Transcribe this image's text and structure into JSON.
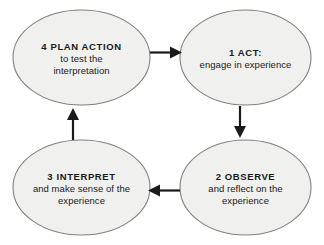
{
  "diagram": {
    "name": "experiential-learning-cycle",
    "background_color": "#ffffff",
    "node_fill": "#f0f0ee",
    "node_stroke": "#808080",
    "arrow_color": "#1a1a1a",
    "text_color": "#1a1a1a",
    "nodes": [
      {
        "id": "plan",
        "title": "4 PLAN ACTION",
        "line2": "to test the",
        "line3": "interpretation",
        "position": "top-left"
      },
      {
        "id": "act",
        "title": "1 ACT:",
        "line2": "engage in experience",
        "line3": "",
        "position": "top-right"
      },
      {
        "id": "observe",
        "title": "2 OBSERVE",
        "line2": "and reflect on the",
        "line3": "experience",
        "position": "bottom-right"
      },
      {
        "id": "interpret",
        "title": "3 INTERPRET",
        "line2": "and make sense of the",
        "line3": "experience",
        "position": "bottom-left"
      }
    ],
    "arrows": [
      {
        "id": "plan-to-act",
        "direction": "right",
        "from": "plan",
        "to": "act"
      },
      {
        "id": "act-to-observe",
        "direction": "down",
        "from": "act",
        "to": "observe"
      },
      {
        "id": "observe-to-interpret",
        "direction": "left",
        "from": "observe",
        "to": "interpret"
      },
      {
        "id": "interpret-to-plan",
        "direction": "up",
        "from": "interpret",
        "to": "plan"
      }
    ]
  }
}
